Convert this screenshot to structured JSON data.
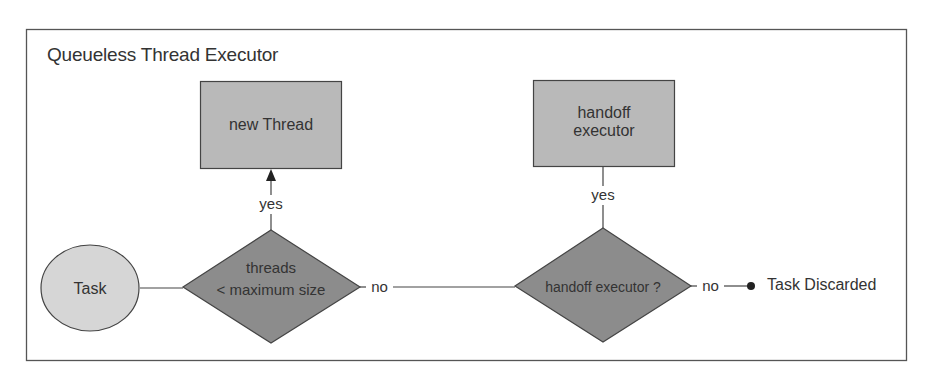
{
  "diagram": {
    "title": "Queueless Thread Executor",
    "nodes": {
      "task": {
        "label": "Task",
        "shape": "ellipse"
      },
      "decision_threads": {
        "line1": "threads",
        "line2": "< maximum size",
        "shape": "diamond"
      },
      "new_thread": {
        "label": "new Thread",
        "shape": "rectangle"
      },
      "decision_handoff": {
        "label": "handoff executor ?",
        "shape": "diamond"
      },
      "handoff_executor": {
        "line1": "handoff",
        "line2": "executor",
        "shape": "rectangle"
      },
      "task_discarded": {
        "label": "Task Discarded",
        "shape": "terminal-dot"
      }
    },
    "edges": {
      "threads_yes": "yes",
      "threads_no": "no",
      "handoff_yes": "yes",
      "handoff_no": "no"
    },
    "colors": {
      "border": "#555555",
      "box_fill": "#b9b9b9",
      "diamond_fill": "#8c8c8c",
      "ellipse_fill": "#d6d6d6",
      "line": "#444444"
    }
  }
}
